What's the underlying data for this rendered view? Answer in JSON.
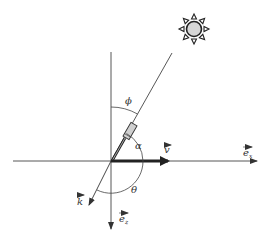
{
  "diagram": {
    "title": "",
    "angles": {
      "phi": "ϕ",
      "alpha": "α",
      "theta": "θ"
    },
    "vectors": {
      "v": "v",
      "k": "k",
      "ex": {
        "base": "e",
        "sub": "x"
      },
      "ez": {
        "base": "e",
        "sub": "z"
      }
    },
    "objects": {
      "sun": "sun-icon",
      "sensor": "sensor-cylinder"
    },
    "colors": {
      "line": "#333333",
      "sun_fill": "#d6d6d6",
      "sensor_fill": "#d0d0d0"
    }
  }
}
